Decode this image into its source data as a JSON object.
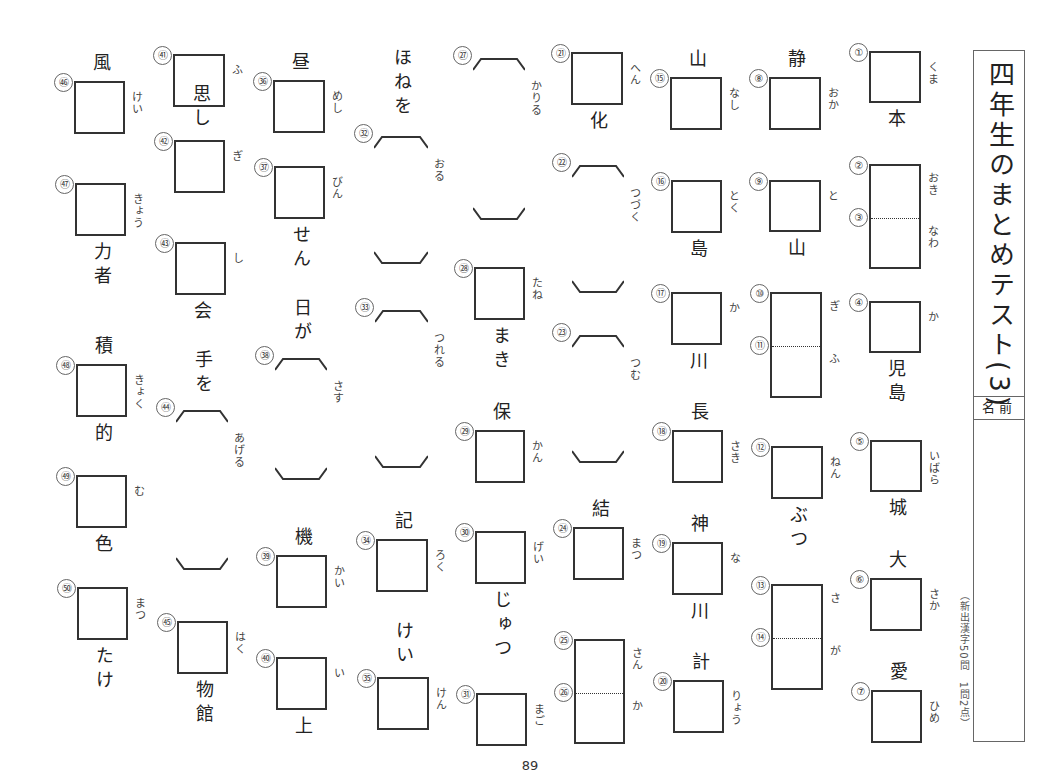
{
  "title_vertical": "四年生のまとめテスト(3)",
  "name_label": "名前",
  "score_note": "（新出漢字50問　1問2点）",
  "page_number": "89",
  "colors": {
    "line": "#333333",
    "text": "#222222",
    "furigana": "#444444",
    "background": "#ffffff"
  },
  "items": [
    {
      "n": "①",
      "box": {
        "x": 869,
        "y": 51,
        "w": 52,
        "h": 52
      },
      "furi": "くま",
      "clue_below": "本"
    },
    {
      "n": "②",
      "box": {
        "x": 869,
        "y": 164,
        "w": 52,
        "h": 105
      },
      "divider_n": "③",
      "furi": "おき",
      "furi2": "なわ"
    },
    {
      "n": "④",
      "box": {
        "x": 869,
        "y": 301,
        "w": 52,
        "h": 52
      },
      "furi": "か",
      "clue_below": "児島"
    },
    {
      "n": "⑤",
      "box": {
        "x": 870,
        "y": 440,
        "w": 52,
        "h": 52
      },
      "furi": "いばら",
      "clue_below": "城"
    },
    {
      "n": "⑥",
      "box": {
        "x": 870,
        "y": 578,
        "w": 52,
        "h": 53
      },
      "furi": "さか",
      "clue_above": "大"
    },
    {
      "n": "⑦",
      "box": {
        "x": 871,
        "y": 690,
        "w": 51,
        "h": 53
      },
      "furi": "ひめ",
      "clue_above": "愛"
    },
    {
      "n": "⑧",
      "box": {
        "x": 769,
        "y": 77,
        "w": 52,
        "h": 53
      },
      "furi": "おか",
      "clue_above": "静"
    },
    {
      "n": "⑨",
      "box": {
        "x": 769,
        "y": 180,
        "w": 52,
        "h": 52
      },
      "furi": "と",
      "clue_below": "山"
    },
    {
      "n": "⑩",
      "box": {
        "x": 770,
        "y": 292,
        "w": 52,
        "h": 106
      },
      "divider_n": "⑪",
      "furi": "ぎ",
      "furi2": "ふ"
    },
    {
      "n": "⑫",
      "box": {
        "x": 771,
        "y": 446,
        "w": 52,
        "h": 53
      },
      "furi": "ねん",
      "clue_below": "ぶつ"
    },
    {
      "n": "⑬",
      "box": {
        "x": 771,
        "y": 584,
        "w": 52,
        "h": 106
      },
      "divider_n": "⑭",
      "furi": "さ",
      "furi2": "が"
    },
    {
      "n": "⑮",
      "box": {
        "x": 670,
        "y": 77,
        "w": 52,
        "h": 53
      },
      "furi": "なし",
      "clue_above": "山"
    },
    {
      "n": "⑯",
      "box": {
        "x": 671,
        "y": 180,
        "w": 51,
        "h": 53
      },
      "furi": "とく",
      "clue_below": "島"
    },
    {
      "n": "⑰",
      "box": {
        "x": 671,
        "y": 292,
        "w": 51,
        "h": 53
      },
      "furi": "か",
      "clue_below": "川"
    },
    {
      "n": "⑱",
      "box": {
        "x": 672,
        "y": 430,
        "w": 51,
        "h": 53
      },
      "furi": "さき",
      "clue_above": "長"
    },
    {
      "n": "⑲",
      "box": {
        "x": 672,
        "y": 542,
        "w": 51,
        "h": 53
      },
      "furi": "な",
      "clue_above": "神",
      "clue_below": "川"
    },
    {
      "n": "⑳",
      "box": {
        "x": 673,
        "y": 680,
        "w": 51,
        "h": 53
      },
      "furi": "りょう",
      "clue_above": "計"
    },
    {
      "n": "㉑",
      "box": {
        "x": 571,
        "y": 52,
        "w": 52,
        "h": 53
      },
      "furi": "へん",
      "clue_below": "化"
    },
    {
      "n": "㉔",
      "box": {
        "x": 573,
        "y": 527,
        "w": 51,
        "h": 53
      },
      "furi": "まつ",
      "clue_above": "結"
    },
    {
      "n": "㉕",
      "box": {
        "x": 574,
        "y": 639,
        "w": 51,
        "h": 105
      },
      "divider_n": "㉖",
      "furi": "さん",
      "furi2": "か"
    },
    {
      "n": "㉘",
      "box": {
        "x": 474,
        "y": 267,
        "w": 51,
        "h": 53
      },
      "furi": "たね",
      "clue_below": "まき"
    },
    {
      "n": "㉙",
      "box": {
        "x": 475,
        "y": 430,
        "w": 50,
        "h": 53
      },
      "furi": "かん",
      "clue_above": "保"
    },
    {
      "n": "㉚",
      "box": {
        "x": 475,
        "y": 531,
        "w": 51,
        "h": 53
      },
      "furi": "げい",
      "clue_below": "じゅつ"
    },
    {
      "n": "㉛",
      "box": {
        "x": 476,
        "y": 693,
        "w": 51,
        "h": 53
      },
      "furi": "まご"
    },
    {
      "n": "㉞",
      "box": {
        "x": 376,
        "y": 539,
        "w": 52,
        "h": 53
      },
      "furi": "ろく",
      "clue_above": "記"
    },
    {
      "n": "㉟",
      "box": {
        "x": 377,
        "y": 677,
        "w": 52,
        "h": 53
      },
      "furi": "けん",
      "clue_above": "けい"
    },
    {
      "n": "㊱",
      "box": {
        "x": 273,
        "y": 80,
        "w": 52,
        "h": 53
      },
      "furi": "めし",
      "clue_above": "昼"
    },
    {
      "n": "㊲",
      "box": {
        "x": 274,
        "y": 166,
        "w": 51,
        "h": 53
      },
      "furi": "びん",
      "clue_below": "せん"
    },
    {
      "n": "㊴",
      "box": {
        "x": 276,
        "y": 555,
        "w": 51,
        "h": 53
      },
      "furi": "かい",
      "clue_above": "機"
    },
    {
      "n": "㊵",
      "box": {
        "x": 276,
        "y": 657,
        "w": 51,
        "h": 53
      },
      "furi": "い",
      "clue_below": "上"
    },
    {
      "n": "㊶",
      "box": {
        "x": 173,
        "y": 54,
        "w": 52,
        "h": 53
      },
      "furi": "ふ"
    },
    {
      "n": "㊷",
      "box": {
        "x": 174,
        "y": 140,
        "w": 51,
        "h": 53
      },
      "furi": "ぎ",
      "clue_above": "思し"
    },
    {
      "n": "㊸",
      "box": {
        "x": 175,
        "y": 242,
        "w": 51,
        "h": 53
      },
      "furi": "し",
      "clue_below": "会"
    },
    {
      "n": "㊺",
      "box": {
        "x": 177,
        "y": 621,
        "w": 51,
        "h": 53
      },
      "furi": "はく",
      "clue_below": "物館"
    },
    {
      "n": "㊻",
      "box": {
        "x": 74,
        "y": 81,
        "w": 51,
        "h": 53
      },
      "furi": "けい",
      "clue_above": "風"
    },
    {
      "n": "㊼",
      "box": {
        "x": 75,
        "y": 183,
        "w": 51,
        "h": 53
      },
      "furi": "きょう",
      "clue_below": "力者"
    },
    {
      "n": "㊽",
      "box": {
        "x": 76,
        "y": 364,
        "w": 51,
        "h": 53
      },
      "furi": "きょく",
      "clue_above": "積",
      "clue_below": "的"
    },
    {
      "n": "㊾",
      "box": {
        "x": 76,
        "y": 475,
        "w": 51,
        "h": 53
      },
      "furi": "む",
      "clue_below": "色"
    },
    {
      "n": "㊿",
      "box": {
        "x": 77,
        "y": 587,
        "w": 51,
        "h": 53
      },
      "furi": "まつ",
      "clue_below": "たけ"
    }
  ],
  "okurigana_items": [
    {
      "n": "㉒",
      "x": 572,
      "y": 165,
      "w": 52,
      "h": 128,
      "furi": "つづく"
    },
    {
      "n": "㉓",
      "x": 572,
      "y": 335,
      "w": 52,
      "h": 128,
      "furi": "つむ"
    },
    {
      "n": "㉗",
      "x": 473,
      "y": 58,
      "w": 52,
      "h": 162,
      "furi": "かりる"
    },
    {
      "n": "㉜",
      "x": 374,
      "y": 136,
      "w": 54,
      "h": 128,
      "furi": "おる",
      "clue_above": "ほねを"
    },
    {
      "n": "㉝",
      "x": 375,
      "y": 310,
      "w": 53,
      "h": 158,
      "furi": "つれる"
    },
    {
      "n": "㊳",
      "x": 275,
      "y": 358,
      "w": 52,
      "h": 122,
      "furi": "さす",
      "clue_above": "日が"
    },
    {
      "n": "㊹",
      "x": 176,
      "y": 410,
      "w": 52,
      "h": 160,
      "furi": "あげる",
      "clue_above": "手を"
    }
  ]
}
